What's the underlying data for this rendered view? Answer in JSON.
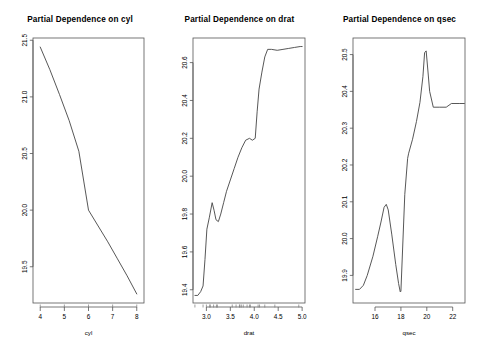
{
  "figure": {
    "background": "#ffffff",
    "line_color": "#444444",
    "axis_color": "#555555",
    "panel_count": 3
  },
  "chart_data": [
    {
      "type": "line",
      "title": "Partial Dependence on cyl",
      "xlabel": "cyl",
      "ylabel": "",
      "xlim": [
        3.7,
        8.3
      ],
      "ylim": [
        19.18,
        21.52
      ],
      "xticks": [
        "4",
        "5",
        "6",
        "7",
        "8"
      ],
      "xtick_values": [
        4,
        5,
        6,
        7,
        8
      ],
      "yticks": [
        "19.5",
        "20.0",
        "20.5",
        "21.0",
        "21.5"
      ],
      "ytick_values": [
        19.5,
        20.0,
        20.5,
        21.0,
        21.5
      ],
      "grid": false,
      "legend": "none",
      "x": [
        4.0,
        4.4,
        4.8,
        5.2,
        5.6,
        6.0,
        6.4,
        6.8,
        7.2,
        7.6,
        8.0
      ],
      "values": [
        21.44,
        21.24,
        21.02,
        20.79,
        20.52,
        20.0,
        19.86,
        19.72,
        19.57,
        19.42,
        19.26
      ],
      "rug_x": [
        4,
        5,
        6,
        7,
        8
      ]
    },
    {
      "type": "line",
      "title": "Partial Dependence on drat",
      "xlabel": "drat",
      "ylabel": "",
      "xlim": [
        2.72,
        5.06
      ],
      "ylim": [
        19.33,
        20.73
      ],
      "xticks": [
        "3.0",
        "3.5",
        "4.0",
        "4.5",
        "5.0"
      ],
      "xtick_values": [
        3.0,
        3.5,
        4.0,
        4.5,
        5.0
      ],
      "yticks": [
        "19.4",
        "19.6",
        "19.8",
        "20.0",
        "20.2",
        "20.4",
        "20.6"
      ],
      "ytick_values": [
        19.4,
        19.6,
        19.8,
        20.0,
        20.2,
        20.4,
        20.6
      ],
      "grid": false,
      "legend": "none",
      "x": [
        2.76,
        2.82,
        2.88,
        2.93,
        2.97,
        3.01,
        3.06,
        3.12,
        3.16,
        3.2,
        3.25,
        3.3,
        3.36,
        3.42,
        3.5,
        3.58,
        3.66,
        3.74,
        3.82,
        3.9,
        3.96,
        4.02,
        4.06,
        4.1,
        4.16,
        4.22,
        4.28,
        4.36,
        4.48,
        4.6,
        4.72,
        4.84,
        4.96,
        5.0
      ],
      "values": [
        19.37,
        19.37,
        19.39,
        19.42,
        19.56,
        19.72,
        19.78,
        19.86,
        19.82,
        19.77,
        19.76,
        19.8,
        19.86,
        19.92,
        19.98,
        20.04,
        20.1,
        20.15,
        20.19,
        20.2,
        20.19,
        20.2,
        20.34,
        20.46,
        20.55,
        20.63,
        20.67,
        20.67,
        20.665,
        20.67,
        20.675,
        20.68,
        20.685,
        20.685
      ],
      "rug_x": [
        2.76,
        2.93,
        3.0,
        3.07,
        3.08,
        3.15,
        3.21,
        3.23,
        3.54,
        3.62,
        3.69,
        3.7,
        3.73,
        3.77,
        3.85,
        3.9,
        3.92,
        4.08,
        4.11,
        4.22,
        4.43,
        4.93
      ]
    },
    {
      "type": "line",
      "title": "Partial Dependence on qsec",
      "xlabel": "qsec",
      "ylabel": "",
      "xlim": [
        14.3,
        22.95
      ],
      "ylim": [
        19.825,
        20.545
      ],
      "xticks": [
        "16",
        "18",
        "20",
        "22"
      ],
      "xtick_values": [
        16,
        18,
        20,
        22
      ],
      "yticks": [
        "19.9",
        "20.0",
        "20.1",
        "20.2",
        "20.3",
        "20.4",
        "20.5"
      ],
      "ytick_values": [
        19.9,
        20.0,
        20.1,
        20.2,
        20.3,
        20.4,
        20.5
      ],
      "grid": false,
      "legend": "none",
      "x": [
        14.5,
        14.8,
        15.1,
        15.4,
        15.84,
        16.2,
        16.46,
        16.7,
        16.87,
        17.02,
        17.3,
        17.6,
        17.82,
        17.95,
        18.0,
        18.3,
        18.52,
        18.6,
        18.9,
        19.2,
        19.47,
        19.7,
        19.83,
        19.95,
        20.1,
        20.22,
        20.5,
        21.0,
        21.5,
        21.9,
        22.1,
        22.5,
        22.9
      ],
      "values": [
        19.862,
        19.862,
        19.873,
        19.9,
        19.952,
        20.005,
        20.045,
        20.085,
        20.093,
        20.078,
        20.01,
        19.93,
        19.878,
        19.855,
        19.857,
        20.12,
        20.218,
        20.232,
        20.27,
        20.318,
        20.37,
        20.44,
        20.505,
        20.51,
        20.45,
        20.4,
        20.357,
        20.357,
        20.357,
        20.367,
        20.367,
        20.367,
        20.367
      ]
    }
  ]
}
